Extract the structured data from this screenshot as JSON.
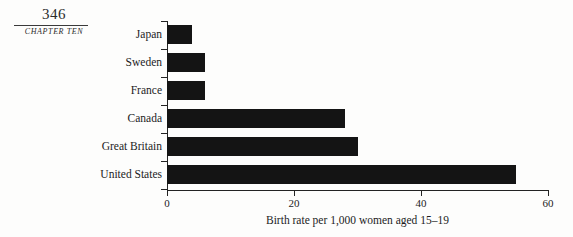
{
  "page": {
    "folio": "346",
    "chapter_label": "CHAPTER TEN"
  },
  "chart_data": {
    "type": "bar",
    "orientation": "horizontal",
    "title": "",
    "xlabel": "Birth rate per 1,000 women aged 15–19",
    "ylabel": "",
    "categories": [
      "Japan",
      "Sweden",
      "France",
      "Canada",
      "Great Britain",
      "United States"
    ],
    "values": [
      4,
      6,
      6,
      28,
      30,
      55
    ],
    "xlim": [
      0,
      60
    ],
    "xticks": [
      0,
      20,
      40,
      60
    ],
    "xtick_labels": [
      "0",
      "20",
      "40",
      "60"
    ],
    "grid": false,
    "legend": null,
    "bar_color": "#141414",
    "axis_color": "#232323"
  }
}
